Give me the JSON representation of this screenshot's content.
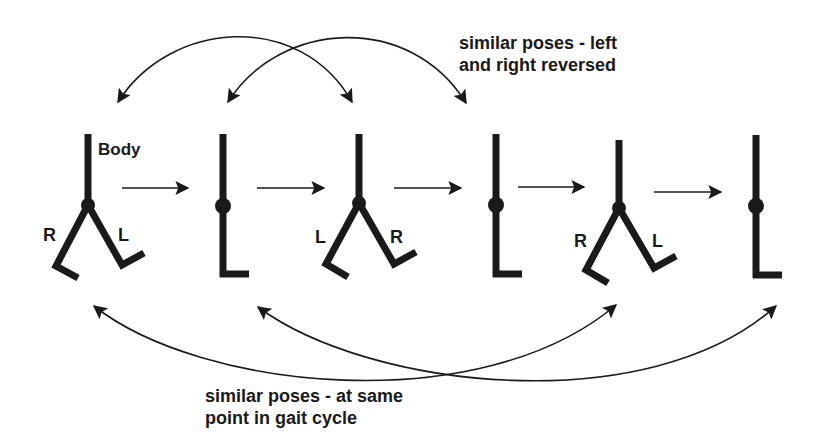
{
  "diagram": {
    "colors": {
      "ink": "#1a1a1a",
      "background": "#ffffff"
    },
    "top_caption": {
      "line1": "similar poses - left",
      "line2": "and right reversed"
    },
    "bottom_caption": {
      "line1": "similar poses - at same",
      "line2": "point in gait cycle"
    },
    "body_label": "Body",
    "figures": [
      {
        "id": 1,
        "pose": "legs-apart",
        "left_leg_label": "R",
        "right_leg_label": "L"
      },
      {
        "id": 2,
        "pose": "legs-together"
      },
      {
        "id": 3,
        "pose": "legs-apart",
        "left_leg_label": "L",
        "right_leg_label": "R"
      },
      {
        "id": 4,
        "pose": "legs-together"
      },
      {
        "id": 5,
        "pose": "legs-apart",
        "left_leg_label": "R",
        "right_leg_label": "L"
      },
      {
        "id": 6,
        "pose": "legs-together"
      }
    ],
    "sequence_arrows": [
      {
        "from": 1,
        "to": 2
      },
      {
        "from": 2,
        "to": 3
      },
      {
        "from": 3,
        "to": 4
      },
      {
        "from": 4,
        "to": 5
      },
      {
        "from": 5,
        "to": 6
      }
    ],
    "top_links": [
      {
        "a": 1,
        "b": 3
      },
      {
        "a": 2,
        "b": 4
      }
    ],
    "bottom_links": [
      {
        "a": 1,
        "b": 5
      },
      {
        "a": 2,
        "b": 6
      }
    ]
  }
}
